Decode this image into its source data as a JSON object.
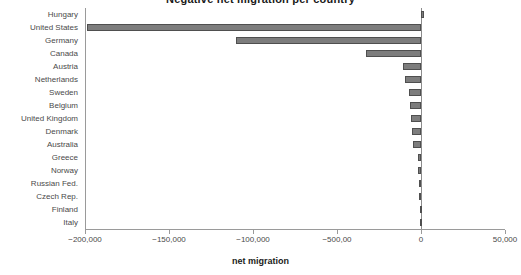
{
  "chart_data": {
    "type": "bar",
    "orientation": "horizontal",
    "title": "Negative net migration per country",
    "xlabel": "net migration",
    "ylabel": "",
    "categories": [
      "Hungary",
      "United States",
      "Germany",
      "Canada",
      "Austria",
      "Netherlands",
      "Sweden",
      "Belgium",
      "United Kingdom",
      "Denmark",
      "Australia",
      "Greece",
      "Norway",
      "Russian Fed.",
      "Czech Rep.",
      "Finland",
      "Italy"
    ],
    "values": [
      1500,
      -199000,
      -110000,
      -33000,
      -10500,
      -9500,
      -7000,
      -6500,
      -6000,
      -5500,
      -5000,
      -2000,
      -1800,
      -1200,
      -1000,
      -800,
      -400
    ],
    "xlim": [
      -200000,
      50000
    ],
    "xticks": [
      -200000,
      -150000,
      -100000,
      -50000,
      0,
      50000
    ],
    "xticklabels": [
      "−200,000",
      "−150,000",
      "−100,000",
      "−500,00",
      "0",
      "50,000"
    ],
    "grid": false,
    "legend": null,
    "bar_color": "#7d7d7d",
    "bar_edge_color": "#4f4f4f",
    "axis_color": "#9a9a9a"
  }
}
